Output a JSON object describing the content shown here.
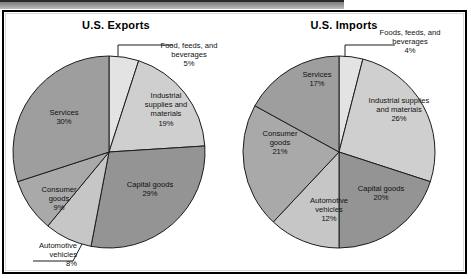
{
  "figure": {
    "background": "#ffffff",
    "frame_color": "#000000"
  },
  "chart_data": [
    {
      "type": "pie",
      "title": "U.S. Exports",
      "categories": [
        "Food, feeds, and beverages",
        "Industrial supplies and materials",
        "Capital goods",
        "Automotive vehicles",
        "Consumer goods",
        "Services"
      ],
      "values": [
        5,
        19,
        29,
        8,
        9,
        30
      ],
      "unit": "%",
      "slice_colors": [
        "#e3e3e3",
        "#cfcfcf",
        "#949494",
        "#c6c6c6",
        "#a9a9a9",
        "#9e9e9e"
      ],
      "start_angle_deg": 0,
      "direction": "clockwise",
      "labels": [
        {
          "id": "food",
          "text": "Food, feeds, and\nbeverages\n5%",
          "placement": "callout-right"
        },
        {
          "id": "ind",
          "text": "Industrial\nsupplies and\nmaterials\n19%",
          "placement": "inside"
        },
        {
          "id": "cap",
          "text": "Capital goods\n29%",
          "placement": "inside"
        },
        {
          "id": "auto",
          "text": "Automotive\nvehicles\n8%",
          "placement": "callout-left"
        },
        {
          "id": "cons",
          "text": "Consumer\ngoods\n9%",
          "placement": "inside"
        },
        {
          "id": "serv",
          "text": "Services\n30%",
          "placement": "inside"
        }
      ]
    },
    {
      "type": "pie",
      "title": "U.S. Imports",
      "categories": [
        "Foods, feeds, and beverages",
        "Industrial supplies and materials",
        "Capital goods",
        "Automotive vehicles",
        "Consumer goods",
        "Services"
      ],
      "values": [
        4,
        26,
        20,
        12,
        21,
        17
      ],
      "unit": "%",
      "slice_colors": [
        "#e3e3e3",
        "#cfcfcf",
        "#949494",
        "#c6c6c6",
        "#a9a9a9",
        "#9e9e9e"
      ],
      "start_angle_deg": 0,
      "direction": "clockwise",
      "labels": [
        {
          "id": "food",
          "text": "Foods, feeds, and\nbeverages\n4%",
          "placement": "callout-right"
        },
        {
          "id": "ind",
          "text": "Industrial supplies\nand materials\n26%",
          "placement": "inside"
        },
        {
          "id": "cap",
          "text": "Capital goods\n20%",
          "placement": "inside"
        },
        {
          "id": "auto",
          "text": "Automotive\nvehicles\n12%",
          "placement": "inside"
        },
        {
          "id": "cons",
          "text": "Consumer\ngoods\n21%",
          "placement": "inside"
        },
        {
          "id": "serv",
          "text": "Services\n17%",
          "placement": "inside"
        }
      ]
    }
  ]
}
